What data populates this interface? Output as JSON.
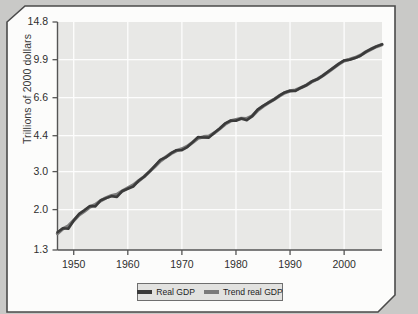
{
  "figure": {
    "background_color": "#c9c9c7",
    "panel_color": "#fcfcfb",
    "plot_background_color": "#e8e8e6",
    "gridline_color": "#fdfdfd",
    "frame_color": "#4a4a4a"
  },
  "axis": {
    "ylabel": "Trillions of 2000 dollars",
    "yticks": [
      "1.3",
      "2.0",
      "3.0",
      "4.4",
      "6.6",
      "9.9",
      "14.8"
    ],
    "xticks": [
      "1950",
      "1960",
      "1970",
      "1980",
      "1990",
      "2000"
    ]
  },
  "legend": {
    "items": [
      {
        "label": "Real GDP",
        "color": "#3a3a3a"
      },
      {
        "label": "Trend real GDP",
        "color": "#7a7a7a"
      }
    ]
  },
  "chart_data": {
    "type": "line",
    "title": "",
    "xlabel": "",
    "ylabel": "Trillions of 2000 dollars",
    "yscale": "log",
    "ylim": [
      1.3,
      14.8
    ],
    "xlim": [
      1947,
      2007
    ],
    "ytick_values": [
      1.3,
      2.0,
      3.0,
      4.4,
      6.6,
      9.9,
      14.8
    ],
    "xtick_values": [
      1950,
      1960,
      1970,
      1980,
      1990,
      2000
    ],
    "grid": true,
    "legend_position": "below-axes",
    "x": [
      1947,
      1948,
      1949,
      1950,
      1951,
      1952,
      1953,
      1954,
      1955,
      1956,
      1957,
      1958,
      1959,
      1960,
      1961,
      1962,
      1963,
      1964,
      1965,
      1966,
      1967,
      1968,
      1969,
      1970,
      1971,
      1972,
      1973,
      1974,
      1975,
      1976,
      1977,
      1978,
      1979,
      1980,
      1981,
      1982,
      1983,
      1984,
      1985,
      1986,
      1987,
      1988,
      1989,
      1990,
      1991,
      1992,
      1993,
      1994,
      1995,
      1996,
      1997,
      1998,
      1999,
      2000,
      2001,
      2002,
      2003,
      2004,
      2005,
      2006,
      2007
    ],
    "series": [
      {
        "name": "Real GDP",
        "color": "#3a3a3a",
        "values": [
          1.57,
          1.64,
          1.63,
          1.78,
          1.91,
          1.99,
          2.08,
          2.07,
          2.21,
          2.26,
          2.31,
          2.29,
          2.44,
          2.5,
          2.56,
          2.72,
          2.84,
          3.0,
          3.19,
          3.4,
          3.49,
          3.65,
          3.77,
          3.77,
          3.9,
          4.11,
          4.34,
          4.32,
          4.31,
          4.54,
          4.75,
          5.02,
          5.17,
          5.16,
          5.29,
          5.19,
          5.42,
          5.81,
          6.05,
          6.26,
          6.47,
          6.74,
          6.98,
          7.11,
          7.1,
          7.34,
          7.54,
          7.84,
          8.03,
          8.33,
          8.7,
          9.07,
          9.47,
          9.82,
          9.89,
          10.07,
          10.32,
          10.76,
          11.1,
          11.41,
          11.66
        ]
      },
      {
        "name": "Trend real GDP",
        "color": "#7a7a7a",
        "values": [
          1.55,
          1.63,
          1.68,
          1.78,
          1.89,
          1.97,
          2.06,
          2.11,
          2.2,
          2.27,
          2.32,
          2.35,
          2.44,
          2.52,
          2.6,
          2.72,
          2.84,
          3.0,
          3.17,
          3.36,
          3.5,
          3.64,
          3.75,
          3.82,
          3.93,
          4.1,
          4.29,
          4.35,
          4.38,
          4.53,
          4.74,
          4.98,
          5.15,
          5.22,
          5.29,
          5.28,
          5.43,
          5.76,
          6.02,
          6.25,
          6.47,
          6.72,
          6.95,
          7.1,
          7.16,
          7.34,
          7.54,
          7.82,
          8.04,
          8.33,
          8.68,
          9.05,
          9.44,
          9.78,
          9.93,
          10.11,
          10.36,
          10.74,
          11.08,
          11.39,
          11.63
        ]
      }
    ]
  }
}
